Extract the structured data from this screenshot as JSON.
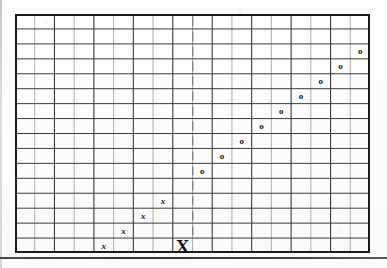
{
  "figure": {
    "kind": "grid-marker-diagram",
    "background_color": "#fdfdfd",
    "grid": {
      "columns": 18,
      "rows": 16,
      "cell_width": 19.72,
      "cell_height": 14.94,
      "origin_x": 15,
      "origin_y": 14,
      "width": 355,
      "height": 239,
      "minor_line_color": "#8f8f8f",
      "major_line_color": "#3c3c3c",
      "border_color": "#1b1b1b",
      "major_every_columns": 2,
      "major_every_rows": 1
    },
    "axis_marker": {
      "name": "dashed-vertical-line",
      "label": "|",
      "column": 9,
      "from_row": 1,
      "to_row": 15,
      "color": "#5a5a5a",
      "style": "dashed"
    }
  },
  "chart_data": {
    "type": "scatter",
    "title": "",
    "subtitle": "",
    "xlabel": "",
    "ylabel": "",
    "grid": true,
    "legend_position": "none",
    "xlim": [
      0,
      18
    ],
    "ylim": [
      0,
      16
    ],
    "annotations": [
      {
        "name": "origin-marker",
        "text": "X",
        "emphasis": "bold-large",
        "col": 9,
        "row": 16
      }
    ],
    "series": [
      {
        "name": "o-series",
        "marker": "o",
        "points": [
          {
            "col": 10,
            "row": 11
          },
          {
            "col": 11,
            "row": 10
          },
          {
            "col": 12,
            "row": 9
          },
          {
            "col": 13,
            "row": 8
          },
          {
            "col": 14,
            "row": 7
          },
          {
            "col": 15,
            "row": 6
          },
          {
            "col": 16,
            "row": 5
          },
          {
            "col": 17,
            "row": 4
          },
          {
            "col": 18,
            "row": 3
          }
        ]
      },
      {
        "name": "x-series",
        "marker": "x",
        "points": [
          {
            "col": 5,
            "row": 16
          },
          {
            "col": 6,
            "row": 15
          },
          {
            "col": 7,
            "row": 14
          },
          {
            "col": 8,
            "row": 13
          }
        ]
      }
    ]
  },
  "markers": {
    "o_glyph": "o",
    "x_glyph": "x",
    "big_x_glyph": "X",
    "dash_glyph": "|"
  }
}
